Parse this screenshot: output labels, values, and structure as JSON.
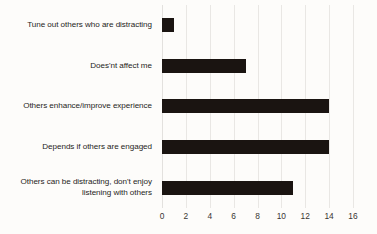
{
  "chart_data": {
    "type": "bar",
    "orientation": "horizontal",
    "title": "",
    "subtitle": "",
    "xlabel": "",
    "ylabel": "",
    "categories": [
      "Tune out others who are distracting",
      "Does'nt affect me",
      "Others enhance/improve experience",
      "Depends if others are engaged",
      "Others can be distracting, don't enjoy listening with others"
    ],
    "category_lines": [
      [
        "Tune out others who are distracting"
      ],
      [
        "Does'nt affect me"
      ],
      [
        "Others enhance/improve experience"
      ],
      [
        "Depends if others are engaged"
      ],
      [
        "Others can be distracting, don't enjoy",
        "listening with others"
      ]
    ],
    "values": [
      1,
      7,
      14,
      14,
      11
    ],
    "xlim": [
      0,
      16
    ],
    "xticks": [
      0,
      2,
      4,
      6,
      8,
      10,
      12,
      14,
      16
    ],
    "xtick_labels": [
      "0",
      "2",
      "4",
      "6",
      "8",
      "10",
      "12",
      "14",
      "16"
    ],
    "grid": "vertical",
    "legend": "none",
    "bar_color": "#1a1411",
    "gridline_color": "#e9e7e4",
    "background_color": "#fdfcfa",
    "label_color": "#1f1c1a"
  }
}
